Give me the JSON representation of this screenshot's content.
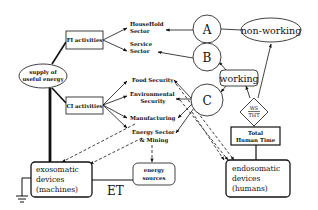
{
  "diagram": {
    "nodes": {
      "supply": {
        "line1": "supply of",
        "line2": "useful energy"
      },
      "fi": {
        "label": "FI activities"
      },
      "ci": {
        "label": "CI activities"
      },
      "household": {
        "line1": "HouseHold",
        "line2": "Sector"
      },
      "service": {
        "line1": "Service",
        "line2": "Sector"
      },
      "food": {
        "label": "Food Security"
      },
      "environmental": {
        "line1": "Environmental",
        "line2": "Security"
      },
      "manufacturing": {
        "label": "Manufacturing"
      },
      "energy_sector": {
        "line1": "Energy Sector",
        "line2": "& Mining"
      },
      "a": {
        "label": "A"
      },
      "b": {
        "label": "B"
      },
      "c": {
        "label": "C"
      },
      "non_working": {
        "label": "non-working"
      },
      "working": {
        "label": "working"
      },
      "ratio": {
        "numerator": "WS",
        "denominator": "THT"
      },
      "total_human_time": {
        "line1": "Total",
        "line2": "Human Time"
      },
      "exosomatic": {
        "line1": "exosomatic",
        "line2": "devices",
        "line3": "(machines)"
      },
      "endosomatic": {
        "line1": "endosomatic",
        "line2": "devices",
        "line3": "(humans)"
      },
      "energy_sources": {
        "line1": "energy",
        "line2": "sources"
      },
      "et": {
        "label": "ET"
      }
    },
    "colors": {
      "ink": "#111111",
      "background": "#ffffff"
    }
  }
}
